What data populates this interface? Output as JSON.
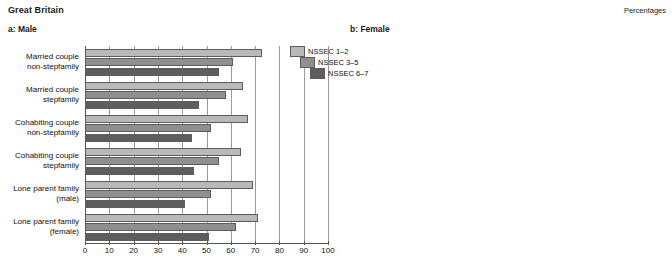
{
  "header": {
    "region_title": "Great Britain",
    "units_label": "Percentages",
    "panel_a_title": "a: Male",
    "panel_b_title": "b: Female"
  },
  "legend": {
    "items": [
      {
        "label": "NSSEC 1–2",
        "color": "#b9b9b9"
      },
      {
        "label": "NSSEC 3–5",
        "color": "#8f8f8f"
      },
      {
        "label": "NSSEC 6–7",
        "color": "#5e5e5e"
      }
    ]
  },
  "axis": {
    "ticks": [
      0,
      10,
      20,
      30,
      40,
      50,
      60,
      70,
      80,
      90,
      100
    ],
    "tick_labels": [
      "0",
      "10",
      "20",
      "30",
      "40",
      "50",
      "60",
      "70",
      "80",
      "90",
      "100"
    ],
    "min": 0,
    "max": 100
  },
  "chart_data": [
    {
      "type": "bar",
      "orientation": "horizontal",
      "title": "a: Male",
      "subtitle": "Great Britain",
      "xlabel": "Percentages",
      "ylabel": "",
      "xlim": [
        0,
        100
      ],
      "grid": true,
      "legend_position": "top-right",
      "categories": [
        "Married couple non-stepfamily",
        "Married couple stepfamily",
        "Cohabiting couple non-stepfamily",
        "Cohabiting couple stepfamily",
        "Lone parent family (male)",
        "Lone parent family (female)"
      ],
      "series": [
        {
          "name": "NSSEC 1–2",
          "values": [
            73,
            65,
            67,
            64,
            69,
            71
          ]
        },
        {
          "name": "NSSEC 3–5",
          "values": [
            61,
            58,
            52,
            55,
            52,
            62
          ]
        },
        {
          "name": "NSSEC 6–7",
          "values": [
            55,
            47,
            44,
            45,
            41,
            51
          ]
        }
      ]
    },
    {
      "type": "bar",
      "orientation": "horizontal",
      "title": "b: Female",
      "subtitle": "Great Britain",
      "xlabel": "Percentages",
      "ylabel": "",
      "xlim": [
        0,
        100
      ],
      "grid": true,
      "legend_position": "none",
      "categories": [
        "Married couple non-stepfamily",
        "Married couple stepfamily",
        "Cohabiting couple non-stepfamily",
        "Cohabiting couple stepfamily",
        "Lone parent family (male)",
        "Lone parent family (female)"
      ],
      "series": [
        {
          "name": "NSSEC 1–2",
          "values": [
            81,
            76,
            77,
            75,
            78,
            80
          ]
        },
        {
          "name": "NSSEC 3–5",
          "values": [
            76,
            70,
            71,
            68,
            70,
            74
          ]
        },
        {
          "name": "NSSEC 6–7",
          "values": [
            72,
            64,
            65,
            64,
            64,
            69
          ]
        }
      ]
    }
  ]
}
